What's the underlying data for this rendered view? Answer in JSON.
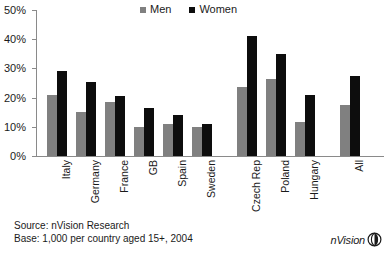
{
  "chart_data": {
    "type": "bar",
    "title": "",
    "xlabel": "",
    "ylabel": "",
    "ylim": [
      0,
      50
    ],
    "ytick_labels": [
      "0%",
      "10%",
      "20%",
      "30%",
      "40%",
      "50%"
    ],
    "ytick_values": [
      0,
      10,
      20,
      30,
      40,
      50
    ],
    "grid": false,
    "legend_position": "top-center",
    "categories": [
      "Italy",
      "Germany",
      "France",
      "GB",
      "Spain",
      "Sweden",
      "Czech Rep",
      "Poland",
      "Hungary",
      "All"
    ],
    "series": [
      {
        "name": "Men",
        "color": "#808080",
        "values": [
          21,
          15,
          18.5,
          10,
          11,
          10,
          23.5,
          26.5,
          11.5,
          17.5
        ]
      },
      {
        "name": "Women",
        "color": "#0d0d0d",
        "values": [
          29,
          25.5,
          20.5,
          16.5,
          14,
          11,
          41,
          35,
          21,
          27.5
        ]
      }
    ],
    "group_gaps_after": [
      "Sweden",
      "Hungary"
    ]
  },
  "legend": {
    "entries": [
      {
        "label": "Men",
        "color": "#808080"
      },
      {
        "label": "Women",
        "color": "#0d0d0d"
      }
    ]
  },
  "footer": {
    "source_line": "Source: nVision Research",
    "base_line": "Base: 1,000 per country aged 15+, 2004"
  },
  "logo": {
    "text": "nVision"
  }
}
